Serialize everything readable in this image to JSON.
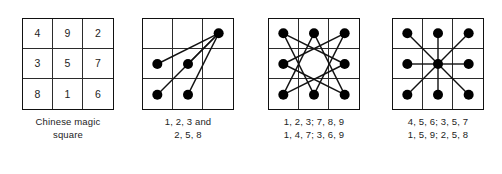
{
  "figure": {
    "background_color": "#ffffff",
    "ink_color": "#111111",
    "dot_color": "#000000",
    "grid_line_color": "#2b2b2b"
  },
  "panels": [
    {
      "id": "magic-square",
      "kind": "numbers",
      "numbers": [
        "4",
        "9",
        "2",
        "3",
        "5",
        "7",
        "8",
        "1",
        "6"
      ],
      "rows": [
        [
          "4",
          "9",
          "2"
        ],
        [
          "3",
          "5",
          "7"
        ],
        [
          "8",
          "1",
          "6"
        ]
      ],
      "dots": [],
      "lines": [],
      "caption_line1": "Chinese magic",
      "caption_line2": "square"
    },
    {
      "id": "paths-fan",
      "kind": "dots",
      "numbers": [
        "",
        "",
        "",
        "",
        "",
        "",
        "",
        "",
        ""
      ],
      "dots": [
        2,
        3,
        4,
        6,
        7
      ],
      "lines": [
        [
          2,
          3
        ],
        [
          2,
          4
        ],
        [
          2,
          6
        ],
        [
          2,
          7
        ]
      ],
      "caption_line1": "1, 2, 3 and",
      "caption_line2": "2, 5, 8"
    },
    {
      "id": "paths-star",
      "kind": "dots",
      "numbers": [
        "",
        "",
        "",
        "",
        "",
        "",
        "",
        "",
        ""
      ],
      "dots": [
        0,
        1,
        2,
        3,
        5,
        6,
        7,
        8
      ],
      "lines": [
        [
          0,
          5
        ],
        [
          5,
          6
        ],
        [
          6,
          1
        ],
        [
          1,
          8
        ],
        [
          8,
          3
        ],
        [
          3,
          2
        ],
        [
          2,
          7
        ],
        [
          7,
          0
        ]
      ],
      "caption_line1": "1, 2, 3; 7, 8, 9",
      "caption_line2": "1, 4, 7; 3, 6, 9"
    },
    {
      "id": "paths-radial",
      "kind": "dots",
      "numbers": [
        "",
        "",
        "",
        "",
        "",
        "",
        "",
        "",
        ""
      ],
      "dots": [
        0,
        1,
        2,
        3,
        4,
        5,
        6,
        7,
        8
      ],
      "lines": [
        [
          4,
          0
        ],
        [
          4,
          1
        ],
        [
          4,
          2
        ],
        [
          4,
          3
        ],
        [
          4,
          5
        ],
        [
          4,
          6
        ],
        [
          4,
          7
        ],
        [
          4,
          8
        ]
      ],
      "caption_line1": "4, 5, 6; 3, 5, 7",
      "caption_line2": "1, 5, 9; 2, 5, 8"
    }
  ],
  "layout": {
    "grid_size_px": 92,
    "panel_offsets_px": [
      22,
      142,
      268,
      392
    ],
    "grid_top_px": 18,
    "dot_radius_px": 5
  }
}
